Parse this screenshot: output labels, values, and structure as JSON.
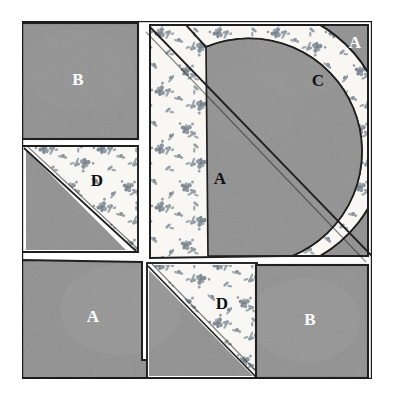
{
  "figure": {
    "kind": "quilt-block-diagram",
    "style": "hand-drawn pencil illustration",
    "background_color": "#ffffff",
    "solid_fabric_color": "#8d8d8d",
    "print_fabric_color": "#f7f6f2",
    "print_motif_color": "#7f8a94",
    "outline_color": "#1a1a1a",
    "block_bounds": {
      "x": 22,
      "y": 21,
      "width": 350,
      "height": 358
    }
  },
  "labels": [
    {
      "id": "label-b-topleft",
      "text": "B",
      "x": 78,
      "y": 85,
      "tone": "light"
    },
    {
      "id": "label-a-topright",
      "text": "A",
      "x": 355,
      "y": 48,
      "tone": "light"
    },
    {
      "id": "label-c-arc",
      "text": "C",
      "x": 318,
      "y": 86,
      "tone": "dark"
    },
    {
      "id": "label-d-left",
      "text": "D",
      "x": 97,
      "y": 186,
      "tone": "dark"
    },
    {
      "id": "label-a-center",
      "text": "A",
      "x": 220,
      "y": 184,
      "tone": "dark"
    },
    {
      "id": "label-a-bottomleft",
      "text": "A",
      "x": 93,
      "y": 322,
      "tone": "light"
    },
    {
      "id": "label-d-bottom",
      "text": "D",
      "x": 222,
      "y": 309,
      "tone": "dark"
    },
    {
      "id": "label-b-bottomright",
      "text": "B",
      "x": 310,
      "y": 325,
      "tone": "light"
    }
  ],
  "pieces": [
    {
      "id": "piece-b-topleft",
      "letter": "B",
      "shape": "square",
      "fabric": "solid"
    },
    {
      "id": "piece-d-left",
      "letter": "D",
      "shape": "half-square-triangle",
      "fabric": "print"
    },
    {
      "id": "piece-a-large",
      "letter": "A",
      "shape": "large-triangle",
      "fabric": "print"
    },
    {
      "id": "piece-c-arc",
      "letter": "C",
      "shape": "arc-crescent",
      "fabric": "print"
    },
    {
      "id": "piece-a-corner",
      "letter": "A",
      "shape": "corner-triangle",
      "fabric": "solid"
    },
    {
      "id": "piece-a-bottomleft",
      "letter": "A",
      "shape": "large-triangle",
      "fabric": "solid"
    },
    {
      "id": "piece-d-bottom",
      "letter": "D",
      "shape": "half-square-triangle",
      "fabric": "print"
    },
    {
      "id": "piece-b-bottomright",
      "letter": "B",
      "shape": "square",
      "fabric": "solid"
    }
  ]
}
